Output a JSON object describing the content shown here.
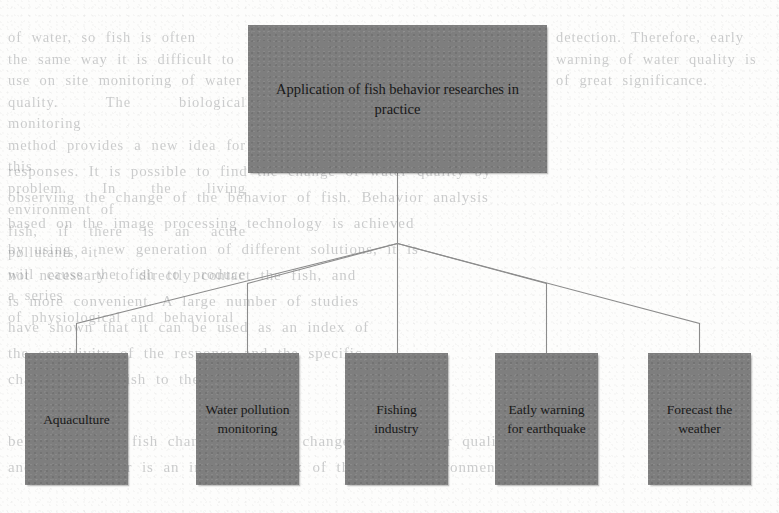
{
  "diagram": {
    "type": "tree-hierarchy",
    "orientation": "top-down",
    "root": {
      "label": "Application of fish behavior researches in practice"
    },
    "children": [
      {
        "label": "Aquaculture"
      },
      {
        "label": "Water pollution monitoring"
      },
      {
        "label": "Fishing industry"
      },
      {
        "label": "Eatly warning for earthquake"
      },
      {
        "label": "Forecast the weather"
      }
    ],
    "colors": {
      "node_fill": "#7e7e7e",
      "node_text": "#181818",
      "connector": "#8c8c8c",
      "page_background": "#fdfdfc"
    }
  },
  "background_text": {
    "note": "faint bleed-through from reverse page; illegible",
    "left": "of water, so fish is often\nthe same way it is difficult to\nuse on site monitoring of water\nquality. The biological monitoring\nmethod provides a new idea for this\nproblem. In the living environment of\nfish, if there is an acute pollutants, it\nwill cause the fish to produce a series\nof physiological and behavioral",
    "right": "detection. Therefore, early\nwarning of water quality is\nof great significance.",
    "middle": "responses. It is possible to find the change of water quality by\nobserving the change of the behavior of fish. Behavior analysis\nbased on the image processing technology is achieved\nby using a new generation of different solutions, it is\nnot necessary to directly contact the fish, and\nis more convenient. A large number of studies\nhave shown that it can be used as an index of\nthe sensitivity of the response and the specific\nchange of the fish to the pollutants.",
    "lower": "behavior of the fish changes with the change of the water quality,\nand the behavior is an important index of the water environment."
  }
}
